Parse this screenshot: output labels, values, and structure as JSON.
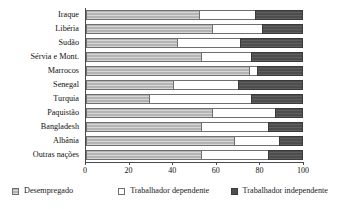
{
  "chart_data": {
    "type": "bar",
    "orientation": "horizontal",
    "stacked": true,
    "stack_mode": "percent",
    "title": "",
    "subtitle": "",
    "xlabel": "",
    "ylabel": "",
    "xlim": [
      0,
      100
    ],
    "xticks": [
      0,
      20,
      40,
      60,
      80,
      100
    ],
    "xtick_labels": [
      "0",
      "20",
      "40",
      "60",
      "80",
      "100"
    ],
    "grid": false,
    "legend_position": "bottom",
    "categories": [
      "Iraque",
      "Libéria",
      "Sudão",
      "Sérvia e Mont.",
      "Marrocos",
      "Senegal",
      "Turquia",
      "Paquistão",
      "Bangladesh",
      "Albânia",
      "Outras nações"
    ],
    "series": [
      {
        "name": "Desempregado",
        "color": "#b4b4b4",
        "values": [
          52,
          58,
          42,
          53,
          75,
          40,
          29,
          58,
          53,
          68,
          53
        ]
      },
      {
        "name": "Trabalhador dependente",
        "color": "#ffffff",
        "values": [
          26,
          23,
          29,
          23,
          4,
          30,
          47,
          29,
          31,
          21,
          31
        ]
      },
      {
        "name": "Trabalhador independente",
        "color": "#4d4d4d",
        "values": [
          22,
          19,
          29,
          24,
          21,
          30,
          24,
          13,
          16,
          11,
          16
        ]
      }
    ],
    "legend": [
      {
        "label": "Desempregado",
        "swatch": "swatch-unemployed"
      },
      {
        "label": "Trabalhador dependente",
        "swatch": "swatch-dependent"
      },
      {
        "label": "Trabalhador independente",
        "swatch": "swatch-independent"
      }
    ]
  }
}
